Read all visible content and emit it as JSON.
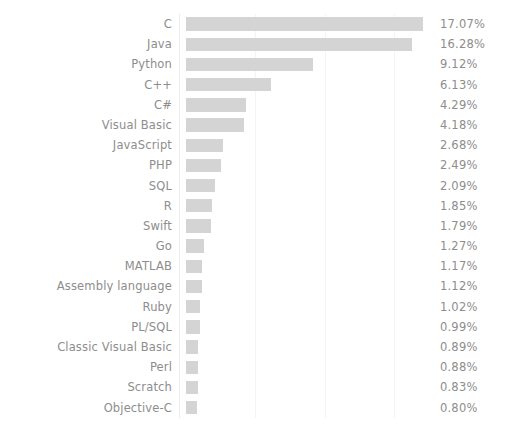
{
  "chart_data": {
    "type": "bar",
    "orientation": "horizontal",
    "title": "",
    "subtitle": "",
    "xlabel": "",
    "ylabel": "",
    "xlim": [
      0,
      18.0
    ],
    "grid": true,
    "gridlines": [
      5,
      10,
      15
    ],
    "legend": "none",
    "bar_color": "#d4d4d4",
    "text_color": "#8d8d8d",
    "background_color": "#ffffff",
    "categories": [
      "C",
      "Java",
      "Python",
      "C++",
      "C#",
      "Visual Basic",
      "JavaScript",
      "PHP",
      "SQL",
      "R",
      "Swift",
      "Go",
      "MATLAB",
      "Assembly language",
      "Ruby",
      "PL/SQL",
      "Classic Visual Basic",
      "Perl",
      "Scratch",
      "Objective-C"
    ],
    "values": [
      17.07,
      16.28,
      9.12,
      6.13,
      4.29,
      4.18,
      2.68,
      2.49,
      2.09,
      1.85,
      1.79,
      1.27,
      1.17,
      1.12,
      1.02,
      0.99,
      0.89,
      0.88,
      0.83,
      0.8
    ],
    "value_labels": [
      "17.07%",
      "16.28%",
      "9.12%",
      "6.13%",
      "4.29%",
      "4.18%",
      "2.68%",
      "2.49%",
      "2.09%",
      "1.85%",
      "1.79%",
      "1.27%",
      "1.17%",
      "1.12%",
      "1.02%",
      "0.99%",
      "0.89%",
      "0.88%",
      "0.83%",
      "0.80%"
    ]
  }
}
